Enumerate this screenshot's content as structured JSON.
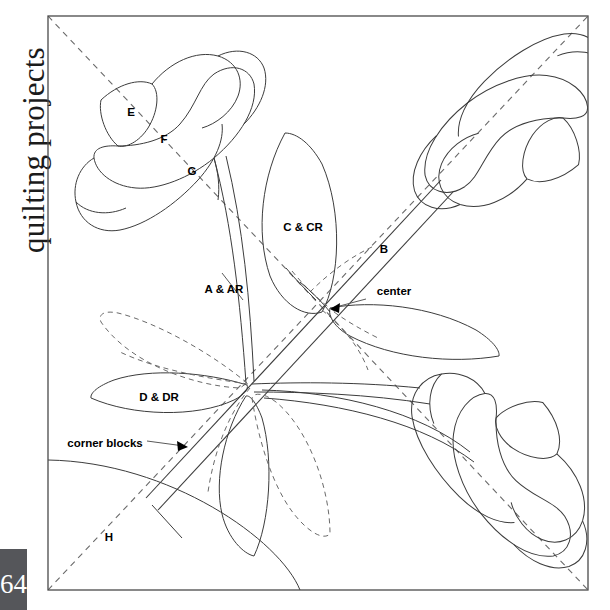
{
  "page": {
    "running_head": "quilting projects",
    "folio": "64",
    "background_color": "#ffffff",
    "line_color": "#3c3c3c",
    "frame_color": "#4a4a4a",
    "folio_tab_color": "#55565a"
  },
  "diagram": {
    "frame": {
      "x": 48,
      "y": 16,
      "width": 540,
      "height": 574
    },
    "labels": [
      {
        "id": "E",
        "text": "E",
        "x": 131,
        "y": 116,
        "anchor": "middle"
      },
      {
        "id": "F",
        "text": "F",
        "x": 164,
        "y": 143,
        "anchor": "middle"
      },
      {
        "id": "G",
        "text": "G",
        "x": 192,
        "y": 175,
        "anchor": "middle"
      },
      {
        "id": "C_CR",
        "text": "C & CR",
        "x": 303,
        "y": 231,
        "anchor": "middle"
      },
      {
        "id": "B",
        "text": "B",
        "x": 384,
        "y": 253,
        "anchor": "middle"
      },
      {
        "id": "A_AR",
        "text": "A & AR",
        "x": 224,
        "y": 293,
        "anchor": "middle"
      },
      {
        "id": "center",
        "text": "center",
        "x": 394,
        "y": 295,
        "anchor": "middle"
      },
      {
        "id": "D_DR",
        "text": "D & DR",
        "x": 159,
        "y": 401,
        "anchor": "middle"
      },
      {
        "id": "corner_blocks",
        "text": "corner blocks",
        "x": 105,
        "y": 447,
        "anchor": "middle"
      },
      {
        "id": "H",
        "text": "H",
        "x": 109,
        "y": 541,
        "anchor": "middle"
      }
    ],
    "leaders": [
      {
        "id": "leader-a-ar",
        "from": [
          243,
          300
        ],
        "to": [
          222,
          273
        ]
      },
      {
        "id": "leader-center",
        "from": [
          366,
          299
        ],
        "to": [
          328,
          308
        ]
      },
      {
        "id": "leader-corner-blocks",
        "from": [
          147,
          441
        ],
        "to": [
          188,
          447
        ]
      }
    ],
    "motifs": [
      "lily-top-left",
      "lily-top-right",
      "lily-bottom-right",
      "leaf-C-CR",
      "leaf-D-DR",
      "leaf-right",
      "leaf-lower-center",
      "stem-A-AR",
      "sash-B",
      "corner-arc-H"
    ]
  }
}
